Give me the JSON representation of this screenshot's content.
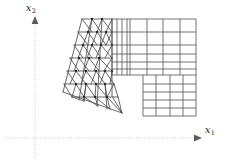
{
  "figure": {
    "kind": "finite-element-mesh-diagram",
    "background_color": "#ffffff",
    "mesh_line_color": "#4d4d4d",
    "node_color": "#262626",
    "axis_color": "#c8c8c8",
    "axes": {
      "origin": [
        35,
        138
      ],
      "x1": {
        "label": "x",
        "subscript": "1",
        "direction": "horizontal-right",
        "style": "dotted",
        "arrow": true,
        "from": [
          6,
          138
        ],
        "to": [
          200,
          138
        ]
      },
      "x2": {
        "label": "x",
        "subscript": "2",
        "direction": "vertical-up",
        "style": "dotted",
        "arrow": true,
        "from": [
          35,
          158
        ],
        "to": [
          35,
          18
        ]
      }
    },
    "regions": [
      {
        "name": "triangular-mesh-region",
        "element_type": "triangle",
        "position": "left",
        "outline": [
          [
            82,
            19
          ],
          [
            112,
            19
          ],
          [
            112,
            96
          ],
          [
            122,
            113
          ],
          [
            78,
            104
          ],
          [
            63,
            92
          ]
        ]
      },
      {
        "name": "transition-quad-strip",
        "element_type": "quadrilateral",
        "position": "upper-middle",
        "outline": [
          [
            112,
            19
          ],
          [
            130,
            19
          ],
          [
            130,
            75
          ],
          [
            112,
            75
          ]
        ]
      },
      {
        "name": "upper-quad-block",
        "element_type": "quadrilateral",
        "position": "upper-right",
        "outline": [
          [
            130,
            19
          ],
          [
            196,
            19
          ],
          [
            196,
            75
          ],
          [
            130,
            75
          ]
        ]
      },
      {
        "name": "lower-quad-block",
        "element_type": "quadrilateral",
        "position": "lower-right",
        "outline": [
          [
            143,
            75
          ],
          [
            196,
            75
          ],
          [
            196,
            116
          ],
          [
            143,
            116
          ]
        ]
      }
    ],
    "tri_mesh": {
      "rows": [
        {
          "y": 19,
          "x_left": 82,
          "x_right": 112,
          "n": 3
        },
        {
          "y": 32,
          "x_left": 78,
          "x_right": 112,
          "n": 3
        },
        {
          "y": 45,
          "x_left": 74,
          "x_right": 112,
          "n": 3
        },
        {
          "y": 58,
          "x_left": 70,
          "x_right": 112,
          "n": 4
        },
        {
          "y": 71,
          "x_left": 67,
          "x_right": 112,
          "n": 4
        },
        {
          "y": 84,
          "x_left": 64,
          "x_right": 114,
          "n": 4
        },
        {
          "y": 97,
          "x_left": 72,
          "x_right": 118,
          "n": 3
        },
        {
          "y": 107,
          "x_left": 88,
          "x_right": 122,
          "n": 2
        }
      ]
    },
    "quad_mesh": {
      "upper_cols": [
        112,
        117,
        122,
        127,
        130,
        147,
        163,
        180,
        196
      ],
      "upper_rows": [
        19,
        32,
        45,
        54,
        62,
        69,
        75
      ],
      "lower_cols": [
        143,
        156,
        170,
        183,
        196
      ],
      "lower_rows": [
        75,
        84,
        92,
        100,
        108,
        116
      ]
    }
  }
}
